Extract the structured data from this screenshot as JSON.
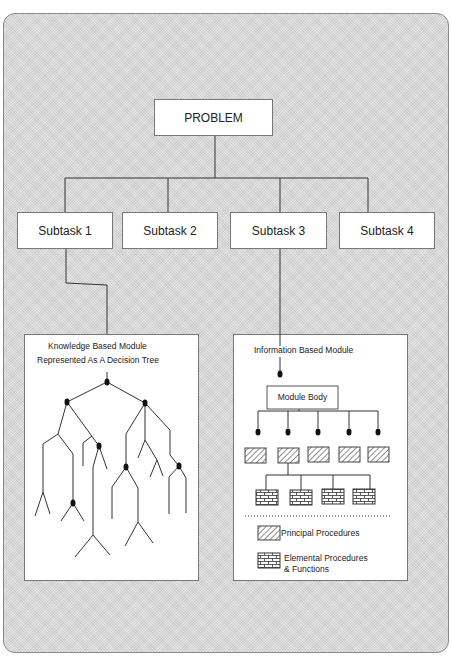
{
  "diagram": {
    "root": {
      "label": "PROBLEM"
    },
    "subtasks": [
      {
        "label": "Subtask 1"
      },
      {
        "label": "Subtask 2"
      },
      {
        "label": "Subtask 3"
      },
      {
        "label": "Subtask 4"
      }
    ],
    "knowledge_module": {
      "title_line1": "Knowledge Based Module",
      "title_line2": "Represented As A Decision Tree"
    },
    "information_module": {
      "title": "Information Based Module",
      "body_label": "Module Body",
      "principal_count": 5,
      "elemental_count": 4
    },
    "legend": [
      {
        "icon": "hatched-box-icon",
        "label": "Principal Procedures"
      },
      {
        "icon": "brick-box-icon",
        "label_line1": "Elemental Procedures",
        "label_line2": "& Functions"
      }
    ],
    "colors": {
      "line": "#333333",
      "box_border": "#777777",
      "background": "#e4e4e4"
    }
  }
}
